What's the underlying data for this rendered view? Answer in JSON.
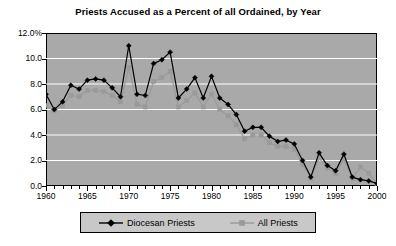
{
  "chart_data": {
    "type": "line",
    "title": "Priests Accused as a Percent of all Ordained, by Year",
    "xlabel": "",
    "ylabel": "",
    "xlim": [
      1960,
      2000
    ],
    "ylim": [
      0.0,
      12.0
    ],
    "grid": true,
    "legend_position": "bottom",
    "y_ticks": [
      "12.0%",
      "10.0",
      "8.0",
      "6.0",
      "4.0",
      "2.0",
      "0.0"
    ],
    "y_tick_values": [
      12.0,
      10.0,
      8.0,
      6.0,
      4.0,
      2.0,
      0.0
    ],
    "x_ticks": [
      "1960",
      "1965",
      "1970",
      "1975",
      "1980",
      "1985",
      "1990",
      "1995",
      "2000"
    ],
    "x_tick_values": [
      1960,
      1965,
      1970,
      1975,
      1980,
      1985,
      1990,
      1995,
      2000
    ],
    "x": [
      1960,
      1961,
      1962,
      1963,
      1964,
      1965,
      1966,
      1967,
      1968,
      1969,
      1970,
      1971,
      1972,
      1973,
      1974,
      1975,
      1976,
      1977,
      1978,
      1979,
      1980,
      1981,
      1982,
      1983,
      1984,
      1985,
      1986,
      1987,
      1988,
      1989,
      1990,
      1991,
      1992,
      1993,
      1994,
      1995,
      1996,
      1997,
      1998,
      1999,
      2000
    ],
    "series": [
      {
        "name": "Diocesan Priests",
        "color": "#000000",
        "marker": "diamond",
        "values": [
          7.2,
          6.0,
          6.6,
          7.9,
          7.6,
          8.3,
          8.4,
          8.3,
          7.7,
          7.0,
          11.0,
          7.2,
          7.1,
          9.6,
          9.9,
          10.5,
          6.9,
          7.6,
          8.5,
          6.9,
          8.6,
          6.9,
          6.4,
          5.6,
          4.3,
          4.6,
          4.6,
          3.9,
          3.5,
          3.6,
          3.3,
          2.0,
          0.7,
          2.6,
          1.6,
          1.2,
          2.5,
          0.7,
          0.5,
          0.4,
          0.2
        ]
      },
      {
        "name": "All Priests",
        "color": "#9a9a9a",
        "marker": "square",
        "values": [
          6.3,
          5.9,
          6.3,
          7.1,
          7.0,
          7.5,
          7.5,
          7.4,
          7.1,
          6.6,
          9.3,
          6.4,
          6.2,
          8.2,
          8.5,
          9.0,
          6.2,
          6.7,
          7.3,
          6.2,
          7.2,
          6.0,
          5.5,
          4.8,
          3.7,
          4.0,
          4.0,
          3.4,
          3.1,
          3.1,
          2.9,
          1.7,
          0.6,
          2.2,
          1.4,
          1.0,
          2.1,
          0.6,
          1.5,
          1.0,
          0.2
        ]
      }
    ]
  },
  "legend": {
    "entries": [
      {
        "label": "Diocesan Priests",
        "icon": "diamond-marker-icon"
      },
      {
        "label": "All Priests",
        "icon": "square-marker-icon"
      }
    ]
  },
  "colors": {
    "plot_background": "#a9a9a9",
    "gridline": "#ffffff",
    "axis": "#000000",
    "legend_background": "#c8c8c8",
    "diocesan": "#000000",
    "all_priests": "#9a9a9a"
  }
}
